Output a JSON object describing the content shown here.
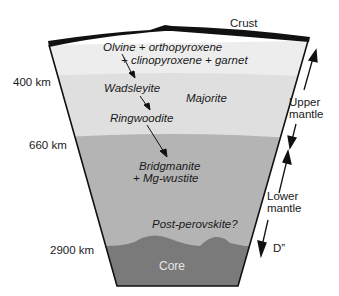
{
  "diagram": {
    "colors": {
      "crust": "#111111",
      "upper_mantle_top": "#ededed",
      "transition_zone": "#dedede",
      "lower_mantle": "#b4b4b4",
      "core": "#777777",
      "outline": "#111111"
    },
    "labels": {
      "crust": "Crust",
      "olivine_line1": "Olvine + orthopyroxene",
      "olivine_line2": "+ clinopyroxene + garnet",
      "wadsleyite": "Wadsleyite",
      "majorite": "Majorite",
      "ringwoodite": "Ringwoodite",
      "bridgmanite_line1": "Bridgmanite",
      "bridgmanite_line2": "+ Mg-wustite",
      "post_perovskite": "Post-perovskite?",
      "core": "Core"
    },
    "depths": [
      {
        "label": "400 km"
      },
      {
        "label": "660 km"
      },
      {
        "label": "2900 km"
      }
    ],
    "regions": {
      "upper_mantle_line1": "Upper",
      "upper_mantle_line2": "mantle",
      "lower_mantle_line1": "Lower",
      "lower_mantle_line2": "mantle",
      "d_double_prime": "D”"
    }
  }
}
